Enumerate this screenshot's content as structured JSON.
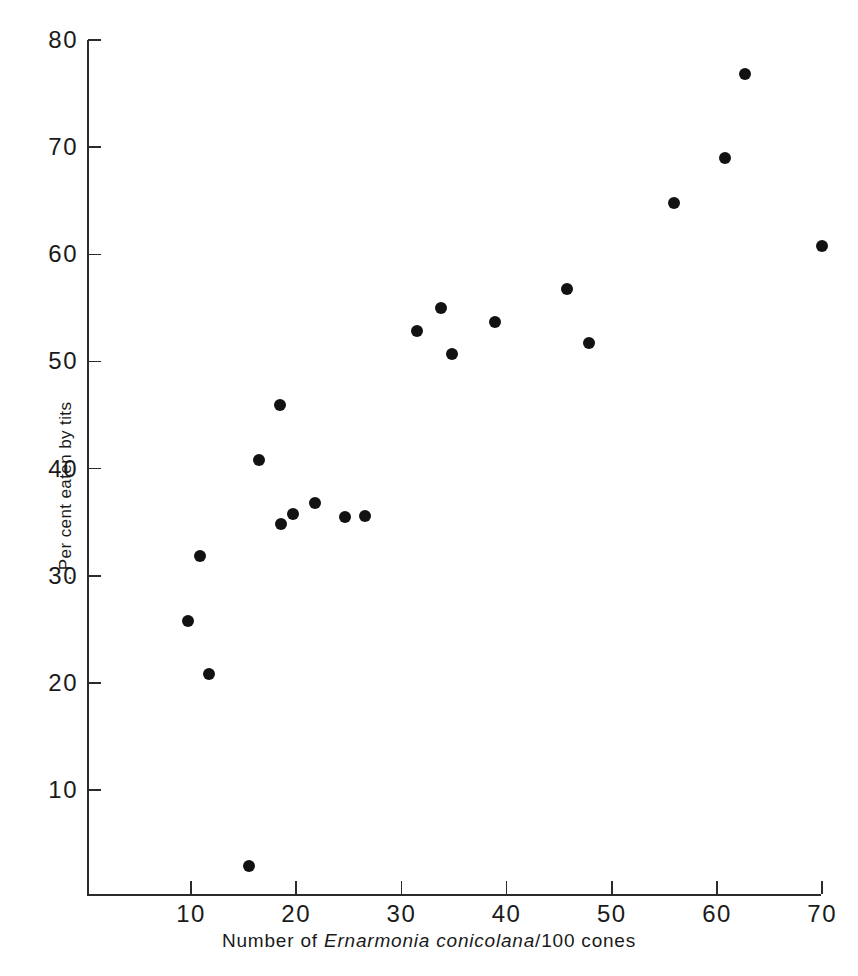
{
  "chart_data": {
    "type": "scatter",
    "title": "",
    "xlabel": "Number of Ernarmonia conicolana/100 cones",
    "xlabel_parts": {
      "prefix": "Number of ",
      "species": "Ernarmonia conicolana",
      "suffix": "/100 cones"
    },
    "ylabel": ". Per cent eaten by tits",
    "xlim": [
      2.5,
      72
    ],
    "ylim": [
      0,
      81
    ],
    "xticks": [
      10,
      20,
      30,
      40,
      50,
      60,
      70
    ],
    "yticks": [
      10,
      20,
      30,
      40,
      50,
      60,
      70,
      80
    ],
    "xticklabels": [
      "10",
      "20",
      "30",
      "40",
      "50",
      "60",
      "70"
    ],
    "yticklabels": [
      "10",
      "20",
      "30",
      "40",
      "50",
      "60",
      "70",
      "80"
    ],
    "grid": false,
    "legend": null,
    "marker": "filled-circle",
    "marker_color": "#121212",
    "background_color": "#ffffff",
    "axis_color": "#2b2b2b",
    "n_points": 21,
    "points": [
      {
        "x": 15.5,
        "y": 2.9
      },
      {
        "x": 11.7,
        "y": 20.8
      },
      {
        "x": 9.7,
        "y": 25.8
      },
      {
        "x": 10.9,
        "y": 31.8
      },
      {
        "x": 18.6,
        "y": 34.8
      },
      {
        "x": 19.7,
        "y": 35.8
      },
      {
        "x": 24.6,
        "y": 35.5
      },
      {
        "x": 26.5,
        "y": 35.6
      },
      {
        "x": 21.8,
        "y": 36.8
      },
      {
        "x": 16.5,
        "y": 40.8
      },
      {
        "x": 18.5,
        "y": 45.9
      },
      {
        "x": 34.8,
        "y": 50.7
      },
      {
        "x": 47.8,
        "y": 51.7
      },
      {
        "x": 31.5,
        "y": 52.8
      },
      {
        "x": 38.9,
        "y": 53.7
      },
      {
        "x": 33.8,
        "y": 55.0
      },
      {
        "x": 45.7,
        "y": 56.8
      },
      {
        "x": 70.0,
        "y": 60.8
      },
      {
        "x": 55.9,
        "y": 64.8
      },
      {
        "x": 60.8,
        "y": 69.0
      },
      {
        "x": 62.7,
        "y": 76.8
      }
    ]
  },
  "geometry": {
    "x_pixel_at_10": 191,
    "x_pixels_per_unit": 10.52,
    "y_pixel_at_10": 790,
    "y_pixels_per_unit": 10.714
  }
}
